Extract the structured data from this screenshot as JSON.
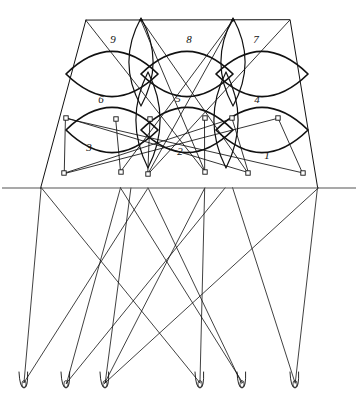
{
  "figure": {
    "background_color": "#ffffff",
    "ink_color": "#111111",
    "baseline_color": "#555555",
    "style": "hand-drawn technical line figure",
    "canvas": {
      "width": 358,
      "height": 407
    }
  },
  "labels": [
    {
      "text": "9",
      "x": 113,
      "y": 40
    },
    {
      "text": "8",
      "x": 189,
      "y": 40
    },
    {
      "text": "7",
      "x": 256,
      "y": 40
    },
    {
      "text": "6",
      "x": 101,
      "y": 100
    },
    {
      "text": "5",
      "x": 178,
      "y": 99
    },
    {
      "text": "4",
      "x": 257,
      "y": 100
    },
    {
      "text": "3",
      "x": 89,
      "y": 148
    },
    {
      "text": "2",
      "x": 180,
      "y": 152
    },
    {
      "text": "1",
      "x": 267,
      "y": 156
    }
  ],
  "outline": {
    "name": "trapezoid-frame",
    "top_left": {
      "x": 86,
      "y": 20
    },
    "top_right": {
      "x": 290,
      "y": 20
    },
    "bottom_left": {
      "x": 41,
      "y": 188
    },
    "bottom_right": {
      "x": 318,
      "y": 188
    }
  },
  "baseline": {
    "name": "horizontal-ground-line",
    "y": 188,
    "x_start": 2,
    "x_end": 356
  },
  "lenses_upper": [
    {
      "id": "lens-9",
      "cx": 112,
      "cy": 74,
      "rx": 46,
      "ry": 22
    },
    {
      "id": "lens-8",
      "cx": 187,
      "cy": 74,
      "rx": 46,
      "ry": 22
    },
    {
      "id": "lens-7",
      "cx": 262,
      "cy": 74,
      "rx": 46,
      "ry": 22
    }
  ],
  "lenses_lower": [
    {
      "id": "lens-3",
      "cx": 112,
      "cy": 130,
      "rx": 46,
      "ry": 22
    },
    {
      "id": "lens-2",
      "cx": 187,
      "cy": 130,
      "rx": 46,
      "ry": 22
    },
    {
      "id": "lens-1",
      "cx": 262,
      "cy": 130,
      "rx": 46,
      "ry": 22
    }
  ],
  "vertical_lenses": [
    {
      "id": "vlens-left",
      "cx": 141,
      "cy": 62,
      "rx": 11,
      "ry": 44
    },
    {
      "id": "vlens-right",
      "cx": 233,
      "cy": 62,
      "rx": 11,
      "ry": 44
    },
    {
      "id": "vlens-mid-left",
      "cx": 148,
      "cy": 120,
      "rx": 11,
      "ry": 48
    },
    {
      "id": "vlens-mid-right",
      "cx": 226,
      "cy": 120,
      "rx": 11,
      "ry": 48
    }
  ],
  "nodes_mid_row": [
    {
      "x": 66,
      "y": 118
    },
    {
      "x": 116,
      "y": 119
    },
    {
      "x": 150,
      "y": 119
    },
    {
      "x": 205,
      "y": 118
    },
    {
      "x": 232,
      "y": 118
    },
    {
      "x": 278,
      "y": 118
    }
  ],
  "nodes_lower_row": [
    {
      "x": 64,
      "y": 173
    },
    {
      "x": 121,
      "y": 172
    },
    {
      "x": 148,
      "y": 174
    },
    {
      "x": 205,
      "y": 172
    },
    {
      "x": 248,
      "y": 173
    },
    {
      "x": 303,
      "y": 173
    }
  ],
  "nodes_upper_apex": [
    {
      "x": 141,
      "y": 20
    },
    {
      "x": 233,
      "y": 20
    }
  ],
  "bottom_loops": [
    {
      "id": "loop-a",
      "x": 24,
      "y": 385
    },
    {
      "id": "loop-b",
      "x": 66,
      "y": 385
    },
    {
      "id": "loop-c",
      "x": 105,
      "y": 385
    },
    {
      "id": "loop-d",
      "x": 200,
      "y": 385
    },
    {
      "id": "loop-e",
      "x": 242,
      "y": 385
    },
    {
      "id": "loop-f",
      "x": 295,
      "y": 385
    }
  ],
  "projection_lines": [
    {
      "from": {
        "x": 41,
        "y": 188
      },
      "to": {
        "x": 24,
        "y": 383
      }
    },
    {
      "from": {
        "x": 41,
        "y": 188
      },
      "to": {
        "x": 200,
        "y": 383
      }
    },
    {
      "from": {
        "x": 121,
        "y": 188
      },
      "to": {
        "x": 66,
        "y": 383
      }
    },
    {
      "from": {
        "x": 121,
        "y": 188
      },
      "to": {
        "x": 242,
        "y": 383
      }
    },
    {
      "from": {
        "x": 131,
        "y": 188
      },
      "to": {
        "x": 105,
        "y": 383
      }
    },
    {
      "from": {
        "x": 148,
        "y": 188
      },
      "to": {
        "x": 24,
        "y": 383
      }
    },
    {
      "from": {
        "x": 148,
        "y": 188
      },
      "to": {
        "x": 242,
        "y": 383
      }
    },
    {
      "from": {
        "x": 205,
        "y": 188
      },
      "to": {
        "x": 105,
        "y": 383
      }
    },
    {
      "from": {
        "x": 205,
        "y": 188
      },
      "to": {
        "x": 200,
        "y": 383
      }
    },
    {
      "from": {
        "x": 225,
        "y": 188
      },
      "to": {
        "x": 66,
        "y": 383
      }
    },
    {
      "from": {
        "x": 233,
        "y": 188
      },
      "to": {
        "x": 295,
        "y": 383
      }
    },
    {
      "from": {
        "x": 318,
        "y": 188
      },
      "to": {
        "x": 295,
        "y": 383
      }
    },
    {
      "from": {
        "x": 318,
        "y": 188
      },
      "to": {
        "x": 105,
        "y": 383
      }
    }
  ],
  "chord_lines": [
    {
      "from": {
        "x": 66,
        "y": 118
      },
      "to": {
        "x": 303,
        "y": 173
      }
    },
    {
      "from": {
        "x": 66,
        "y": 118
      },
      "to": {
        "x": 248,
        "y": 173
      }
    },
    {
      "from": {
        "x": 278,
        "y": 118
      },
      "to": {
        "x": 64,
        "y": 173
      }
    },
    {
      "from": {
        "x": 232,
        "y": 118
      },
      "to": {
        "x": 64,
        "y": 173
      }
    },
    {
      "from": {
        "x": 141,
        "y": 20
      },
      "to": {
        "x": 248,
        "y": 173
      }
    },
    {
      "from": {
        "x": 141,
        "y": 20
      },
      "to": {
        "x": 205,
        "y": 172
      }
    },
    {
      "from": {
        "x": 233,
        "y": 20
      },
      "to": {
        "x": 121,
        "y": 172
      }
    },
    {
      "from": {
        "x": 233,
        "y": 20
      },
      "to": {
        "x": 148,
        "y": 174
      }
    },
    {
      "from": {
        "x": 86,
        "y": 20
      },
      "to": {
        "x": 205,
        "y": 172
      }
    },
    {
      "from": {
        "x": 290,
        "y": 20
      },
      "to": {
        "x": 148,
        "y": 174
      }
    },
    {
      "from": {
        "x": 66,
        "y": 118
      },
      "to": {
        "x": 64,
        "y": 173
      }
    },
    {
      "from": {
        "x": 278,
        "y": 118
      },
      "to": {
        "x": 303,
        "y": 173
      }
    },
    {
      "from": {
        "x": 116,
        "y": 119
      },
      "to": {
        "x": 121,
        "y": 172
      }
    },
    {
      "from": {
        "x": 232,
        "y": 118
      },
      "to": {
        "x": 248,
        "y": 173
      }
    },
    {
      "from": {
        "x": 150,
        "y": 119
      },
      "to": {
        "x": 148,
        "y": 174
      }
    },
    {
      "from": {
        "x": 205,
        "y": 118
      },
      "to": {
        "x": 205,
        "y": 172
      }
    }
  ]
}
